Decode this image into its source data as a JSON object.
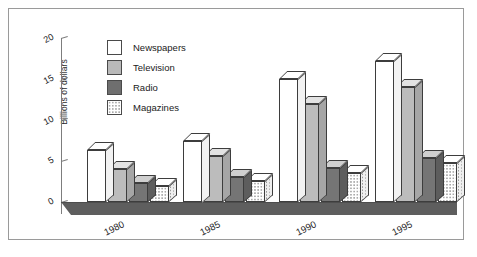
{
  "chart_data": {
    "type": "bar",
    "title": "",
    "xlabel": "",
    "ylabel": "Billions of dollars",
    "categories": [
      "1980",
      "1985",
      "1990",
      "1995"
    ],
    "ylim": [
      0,
      20
    ],
    "yticks": [
      0,
      5,
      10,
      15,
      20
    ],
    "grid": false,
    "legend_position": "top-left",
    "style": "3d-grouped-bar",
    "series": [
      {
        "name": "Newspapers",
        "color": "#ffffff",
        "values": [
          6.4,
          7.5,
          15.0,
          17.2
        ]
      },
      {
        "name": "Television",
        "color": "#bcbcbc",
        "values": [
          4.0,
          5.6,
          12.0,
          14.0
        ]
      },
      {
        "name": "Radio",
        "color": "#757575",
        "values": [
          2.3,
          3.1,
          4.1,
          5.4
        ]
      },
      {
        "name": "Magazines",
        "color": "#ffffff",
        "values": [
          1.9,
          2.6,
          3.5,
          4.7
        ]
      }
    ]
  },
  "axis": {
    "y_label": "Billions of dollars",
    "y_ticks": [
      "20",
      "15",
      "10",
      "5",
      "0"
    ],
    "x_ticks": [
      "1980",
      "1985",
      "1990",
      "1995"
    ]
  },
  "legend": {
    "items": [
      {
        "label": "Newspapers",
        "swatch": "legend-swatch-newspapers"
      },
      {
        "label": "Television",
        "swatch": "legend-swatch-television"
      },
      {
        "label": "Radio",
        "swatch": "legend-swatch-radio"
      },
      {
        "label": "Magazines",
        "swatch": "legend-swatch-magazines"
      }
    ]
  }
}
